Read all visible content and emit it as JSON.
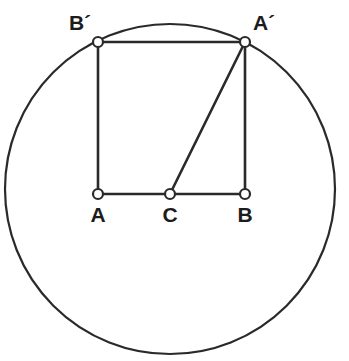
{
  "figure": {
    "canvas": {
      "width": 349,
      "height": 361
    },
    "style": {
      "stroke_color": "#2a2a2a",
      "background_color": "#ffffff",
      "marker_fill": "#ffffff",
      "label_color": "#1c1c1c",
      "circle_stroke_width": 2.2,
      "segment_stroke_width": 2.6,
      "marker_radius": 5,
      "marker_stroke_width": 2.2
    },
    "circle": {
      "name": "circumscribed-circle",
      "center": {
        "x": 170,
        "y": 189
      },
      "radius": 165
    },
    "points": [
      {
        "id": "Bp",
        "label": "B´",
        "x": 98,
        "y": 42,
        "label_x": 80,
        "label_y": 30,
        "on_circle": true
      },
      {
        "id": "Ap",
        "label": "A´",
        "x": 245,
        "y": 42,
        "label_x": 264,
        "label_y": 30,
        "on_circle": true
      },
      {
        "id": "A",
        "label": "A",
        "x": 98,
        "y": 194,
        "label_x": 98,
        "label_y": 222,
        "on_circle": false
      },
      {
        "id": "C",
        "label": "C",
        "x": 170,
        "y": 194,
        "label_x": 170,
        "label_y": 222,
        "on_circle": false
      },
      {
        "id": "B",
        "label": "B",
        "x": 245,
        "y": 194,
        "label_x": 245,
        "label_y": 222,
        "on_circle": false
      }
    ],
    "segments": [
      {
        "id": "seg-Bp-Ap",
        "name": "top-chord",
        "from": "Bp",
        "to": "Ap"
      },
      {
        "id": "seg-Bp-A",
        "name": "left-side",
        "from": "Bp",
        "to": "A"
      },
      {
        "id": "seg-Ap-B",
        "name": "right-side",
        "from": "Ap",
        "to": "B"
      },
      {
        "id": "seg-A-C",
        "name": "bottom-left",
        "from": "A",
        "to": "C"
      },
      {
        "id": "seg-C-B",
        "name": "bottom-right",
        "from": "C",
        "to": "B"
      },
      {
        "id": "seg-Ap-C",
        "name": "diagonal",
        "from": "Ap",
        "to": "C"
      }
    ]
  }
}
